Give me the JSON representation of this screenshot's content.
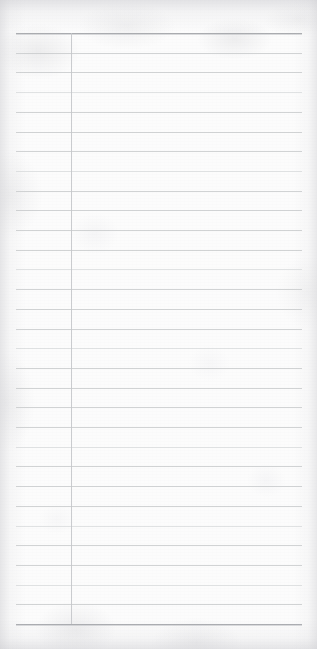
{
  "document": {
    "kind": "scanned-blank-ruled-notebook-paper",
    "orientation": "portrait",
    "width_px": 317,
    "height_px": 649,
    "visible_text": "",
    "handwriting_present": "no",
    "printed_text_present": "no",
    "paper_color_hex": "#fcfcfc",
    "shadow_tint_hex": "#cbcbcf"
  },
  "ruling": {
    "style": "wide-ruled",
    "rule_color_hex": "#c9cbcd",
    "faint_rule_color_hex": "#d6d8da",
    "heavy_rule_color_hex": "#a9abaf",
    "line_thickness_px": 1,
    "line_spacing_px": 19.7,
    "line_count": 31,
    "first_line_y_px": 33,
    "last_line_y_px": 624,
    "line_left_x_px": 16,
    "line_right_x_px": 302,
    "heavy_line_indices": [
      0,
      30
    ],
    "faint_line_indices": [
      3,
      7,
      12,
      16,
      21,
      25,
      28
    ],
    "lines_y_px": [
      33,
      52.7,
      72.4,
      92.1,
      111.8,
      131.5,
      151.2,
      170.9,
      190.6,
      210.3,
      230,
      249.7,
      269.4,
      289.1,
      308.8,
      328.5,
      348.2,
      367.9,
      387.6,
      407.3,
      427,
      446.7,
      466.4,
      486.1,
      505.8,
      525.5,
      545.2,
      564.9,
      584.6,
      604.3,
      624
    ]
  },
  "margin_rule": {
    "present": "yes",
    "orientation": "vertical",
    "color_hex": "#c4c6ca",
    "x_px": 71,
    "top_y_px": 33,
    "bottom_y_px": 624,
    "thickness_px": 1
  }
}
